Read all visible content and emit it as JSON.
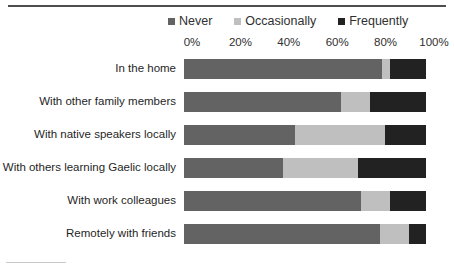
{
  "chart_data": {
    "type": "bar",
    "orientation": "horizontal",
    "stacked": true,
    "stacked_percent": true,
    "title": "",
    "xlabel": "",
    "ylabel": "",
    "xlim": [
      0,
      100
    ],
    "grid": false,
    "legend_position": "top",
    "axis_ticks": [
      "0%",
      "20%",
      "40%",
      "60%",
      "80%",
      "100%"
    ],
    "tick_values": [
      0,
      20,
      40,
      60,
      80,
      100
    ],
    "categories": [
      "In the home",
      "With other family members",
      "With native speakers locally",
      "With others learning Gaelic locally",
      "With work colleagues",
      "Remotely with friends"
    ],
    "series": [
      {
        "name": "Never",
        "color": "#636363",
        "values": [
          82,
          65,
          46,
          41,
          73,
          81
        ]
      },
      {
        "name": "Occasionally",
        "color": "#bfbfbf",
        "values": [
          3,
          12,
          37,
          31,
          12,
          12
        ]
      },
      {
        "name": "Frequently",
        "color": "#222222",
        "values": [
          15,
          23,
          17,
          28,
          15,
          7
        ]
      }
    ]
  },
  "legend": {
    "entries": [
      {
        "label": "Never",
        "color": "#636363"
      },
      {
        "label": "Occasionally",
        "color": "#bfbfbf"
      },
      {
        "label": "Frequently",
        "color": "#222222"
      }
    ]
  }
}
